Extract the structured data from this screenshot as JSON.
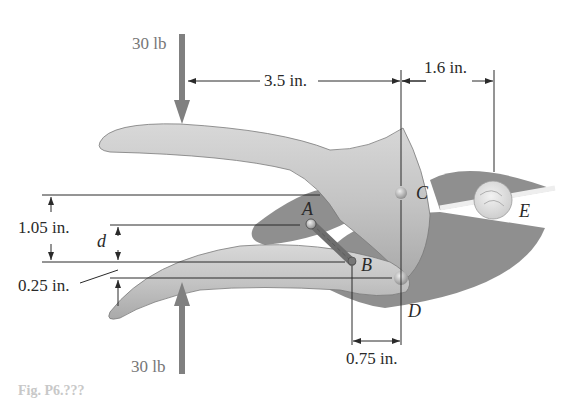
{
  "figure": {
    "forces": {
      "top": "30 lb",
      "bottom": "30 lb"
    },
    "dimensions": {
      "handle_to_C": "3.5 in.",
      "C_to_E": "1.6 in.",
      "vertical_total": "1.05 in.",
      "d": "d",
      "offset": "0.25 in.",
      "B_to_D": "0.75 in."
    },
    "points": {
      "A": "A",
      "B": "B",
      "C": "C",
      "D": "D",
      "E": "E"
    },
    "caption": "Fig. P6.???",
    "colors": {
      "handle": "#bcbcbc",
      "jaw": "#8f8f8f",
      "force_arrow": "#808080",
      "line": "#2a2a2a",
      "label": "#2a2a2a"
    }
  }
}
